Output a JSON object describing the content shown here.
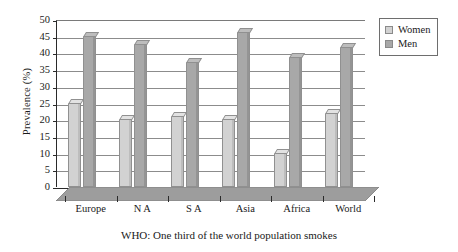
{
  "chart_data": {
    "type": "bar",
    "title": "",
    "caption": "WHO: One third of the world population smokes",
    "categories": [
      "Europe",
      "N A",
      "S A",
      "Asia",
      "Africa",
      "World"
    ],
    "series": [
      {
        "name": "Women",
        "color": "#d2d2d2",
        "values": [
          25,
          20,
          21,
          20,
          10,
          22
        ]
      },
      {
        "name": "Men",
        "color": "#a8a8a8",
        "values": [
          45,
          42.5,
          37,
          46,
          38.5,
          41.5
        ]
      }
    ],
    "xlabel": "",
    "ylabel": "Prevalence (%)",
    "ylim": [
      0,
      50
    ],
    "ytick_step": 5,
    "yticks": [
      "0",
      "5",
      "10",
      "15",
      "20",
      "25",
      "30",
      "35",
      "40",
      "45",
      "50"
    ],
    "grid": true,
    "legend_position": "top-right",
    "style": "3d-columns"
  },
  "legend": {
    "entries": [
      {
        "label": "Women",
        "swatch": "women"
      },
      {
        "label": "Men",
        "swatch": "men"
      }
    ]
  }
}
